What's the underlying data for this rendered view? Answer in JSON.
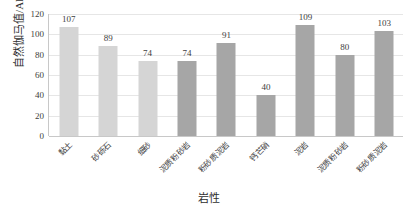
{
  "chart_data": {
    "type": "bar",
    "title": "",
    "xlabel": "岩性",
    "ylabel": "自然伽马值/API",
    "ylim": [
      0,
      120
    ],
    "ytick_step": 20,
    "yticks": [
      0,
      20,
      40,
      60,
      80,
      100,
      120
    ],
    "grid": true,
    "legend": "none",
    "categories": [
      "黏土",
      "砂砾石",
      "细砂",
      "泥质粉砂岩",
      "粉砂质泥岩",
      "钙芒硝",
      "泥岩",
      "泥质粉砂岩",
      "粉砂质泥岩"
    ],
    "values": [
      107,
      89,
      74,
      74,
      91,
      40,
      109,
      80,
      103
    ],
    "bar_colors": [
      "#d5d5d5",
      "#d5d5d5",
      "#d5d5d5",
      "#a6a6a6",
      "#a6a6a6",
      "#a6a6a6",
      "#a6a6a6",
      "#a6a6a6",
      "#a6a6a6"
    ],
    "colors": {
      "light_bar": "#d5d5d5",
      "dark_bar": "#a6a6a6",
      "gridline": "#e6e6e6",
      "axis": "#c8c8c8",
      "text": "#3d3d3d",
      "background": "#ffffff"
    }
  }
}
